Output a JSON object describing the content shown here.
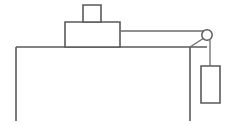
{
  "diagram": {
    "type": "physics-free-body-setup",
    "background_color": "#ffffff",
    "line_color": "#5a5a5a",
    "line_width": 1.6,
    "canvas": {
      "width": 228,
      "height": 126
    },
    "labels": {
      "table": "",
      "block": "",
      "small_block": "",
      "pulley": "",
      "hanging_weight": "",
      "string": ""
    },
    "elements": {
      "table_surface": {
        "name": "table-top-surface",
        "x1": 16,
        "y1": 47,
        "x2": 207,
        "y2": 47
      },
      "table_left_leg": {
        "name": "table-left-leg",
        "x1": 16,
        "y1": 47,
        "x2": 16,
        "y2": 121
      },
      "table_right_leg": {
        "name": "table-right-leg",
        "x1": 190,
        "y1": 47,
        "x2": 190,
        "y2": 121
      },
      "main_block": {
        "name": "main-block",
        "x": 65,
        "y": 22,
        "width": 55,
        "height": 25
      },
      "top_block": {
        "name": "stacked-top-block",
        "x": 83,
        "y": 5,
        "width": 18,
        "height": 17
      },
      "string_horizontal": {
        "name": "string-horizontal-segment",
        "x1": 120,
        "y1": 31,
        "x2": 206,
        "y2": 31
      },
      "pulley": {
        "name": "pulley-wheel",
        "cx": 207,
        "cy": 35,
        "r": 5.2
      },
      "pulley_bracket": {
        "name": "pulley-support-bracket",
        "x1": 190,
        "y1": 47,
        "x2": 204,
        "y2": 38
      },
      "string_vertical": {
        "name": "string-vertical-segment",
        "x1": 210,
        "y1": 40,
        "x2": 210,
        "y2": 66
      },
      "hanging_weight": {
        "name": "hanging-weight-block",
        "x": 201,
        "y": 66,
        "width": 19,
        "height": 37
      }
    }
  }
}
